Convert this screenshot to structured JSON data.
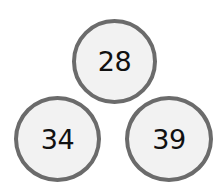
{
  "diagram": {
    "type": "number-triangle",
    "nodes": [
      {
        "id": "top",
        "value": "28",
        "position": "top-center"
      },
      {
        "id": "left",
        "value": "34",
        "position": "bottom-left"
      },
      {
        "id": "right",
        "value": "39",
        "position": "bottom-right"
      }
    ],
    "colors": {
      "circle_border": "#6b6b6b",
      "circle_fill": "#f2f2f2",
      "text": "#111111"
    }
  }
}
